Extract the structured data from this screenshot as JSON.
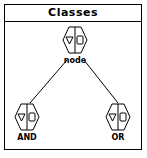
{
  "window": {
    "title": "Classes"
  },
  "diagram": {
    "nodes": [
      {
        "id": "node",
        "label": "node",
        "icon": "class-icon"
      },
      {
        "id": "and",
        "label": "AND",
        "icon": "class-icon"
      },
      {
        "id": "or",
        "label": "OR",
        "icon": "class-icon"
      }
    ],
    "edges": [
      {
        "from": "node",
        "to": "and"
      },
      {
        "from": "node",
        "to": "or"
      }
    ]
  }
}
